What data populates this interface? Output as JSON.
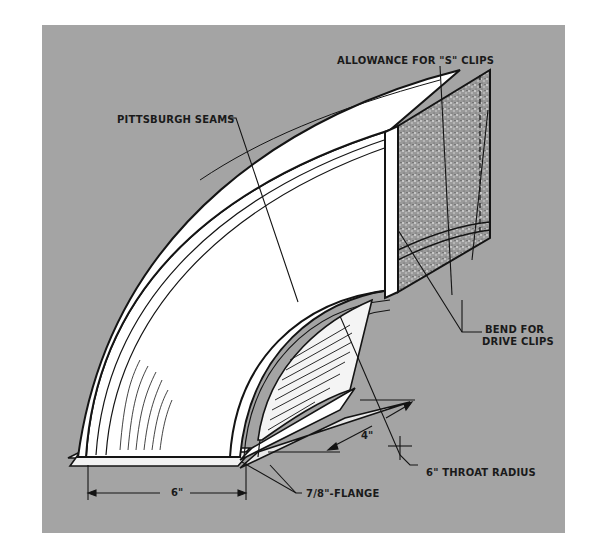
{
  "figure": {
    "background_color": "#a4a4a4",
    "line_color": "#141414",
    "fill_color": "#ffffff",
    "cross_section_fill": "#8a8a8a"
  },
  "callouts": {
    "s_clips": "ALLOWANCE FOR \"S\" CLIPS",
    "pittsburgh": "PITTSBURGH SEAMS",
    "drive_clips_line1": "BEND FOR",
    "drive_clips_line2": "DRIVE CLIPS",
    "throat_radius": "6\" THROAT RADIUS",
    "flange": "7/8\"-FLANGE"
  },
  "dimensions": {
    "width": "6\"",
    "depth": "4\""
  }
}
